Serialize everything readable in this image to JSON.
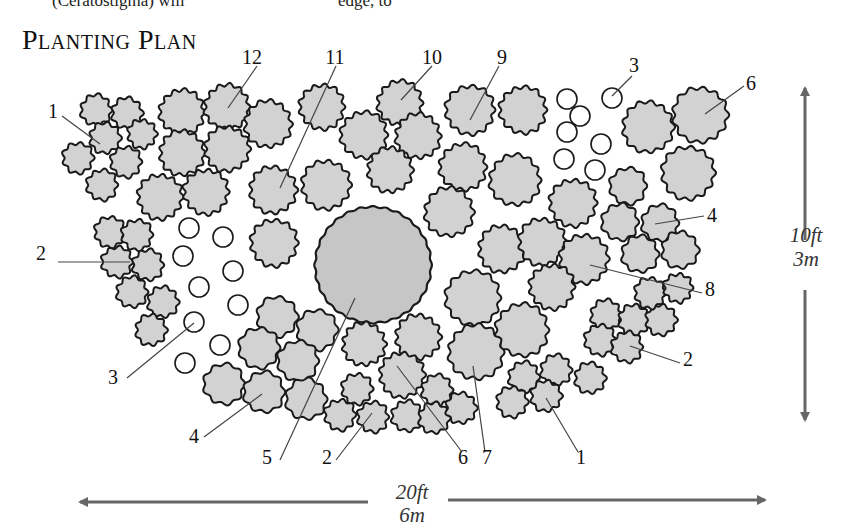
{
  "header": {
    "cut_text_left": "(Ceratostigma) will",
    "cut_text_right": "edge, to"
  },
  "title": "Planting Plan",
  "colors": {
    "plant_fill": "#d2d2d2",
    "plant_stroke": "#1a1a1a",
    "tree_fill": "#c6c6c6",
    "bulb_stroke": "#1a1a1a",
    "leader": "#444444",
    "arrow": "#666666"
  },
  "dimensions": {
    "height": {
      "ft": "10ft",
      "m": "3m"
    },
    "width": {
      "ft": "20ft",
      "m": "6m"
    }
  },
  "labels": [
    {
      "text": "1",
      "x": 53,
      "y": 118,
      "lx1": 62,
      "ly1": 116,
      "lx2": 100,
      "ly2": 144
    },
    {
      "text": "12",
      "x": 252,
      "y": 64,
      "lx1": 257,
      "ly1": 66,
      "lx2": 228,
      "ly2": 108
    },
    {
      "text": "11",
      "x": 335,
      "y": 64,
      "lx1": 336,
      "ly1": 66,
      "lx2": 280,
      "ly2": 188
    },
    {
      "text": "10",
      "x": 432,
      "y": 64,
      "lx1": 432,
      "ly1": 66,
      "lx2": 401,
      "ly2": 100
    },
    {
      "text": "9",
      "x": 502,
      "y": 64,
      "lx1": 499,
      "ly1": 66,
      "lx2": 470,
      "ly2": 120
    },
    {
      "text": "3",
      "x": 634,
      "y": 72,
      "lx1": 632,
      "ly1": 76,
      "lx2": 612,
      "ly2": 96
    },
    {
      "text": "6",
      "x": 751,
      "y": 90,
      "lx1": 744,
      "ly1": 86,
      "lx2": 705,
      "ly2": 114
    },
    {
      "text": "4",
      "x": 712,
      "y": 222,
      "lx1": 704,
      "ly1": 216,
      "lx2": 655,
      "ly2": 224
    },
    {
      "text": "8",
      "x": 710,
      "y": 296,
      "lx1": 702,
      "ly1": 293,
      "lx2": 590,
      "ly2": 265
    },
    {
      "text": "2",
      "x": 688,
      "y": 366,
      "lx1": 680,
      "ly1": 363,
      "lx2": 630,
      "ly2": 346
    },
    {
      "text": "1",
      "x": 581,
      "y": 464,
      "lx1": 578,
      "ly1": 452,
      "lx2": 546,
      "ly2": 398
    },
    {
      "text": "7",
      "x": 487,
      "y": 464,
      "lx1": 485,
      "ly1": 452,
      "lx2": 473,
      "ly2": 366
    },
    {
      "text": "6",
      "x": 463,
      "y": 464,
      "lx1": 462,
      "ly1": 452,
      "lx2": 397,
      "ly2": 366
    },
    {
      "text": "2",
      "x": 327,
      "y": 464,
      "lx1": 336,
      "ly1": 460,
      "lx2": 372,
      "ly2": 413
    },
    {
      "text": "5",
      "x": 267,
      "y": 464,
      "lx1": 280,
      "ly1": 460,
      "lx2": 355,
      "ly2": 298
    },
    {
      "text": "4",
      "x": 194,
      "y": 443,
      "lx1": 204,
      "ly1": 437,
      "lx2": 262,
      "ly2": 394
    },
    {
      "text": "3",
      "x": 113,
      "y": 384,
      "lx1": 127,
      "ly1": 378,
      "lx2": 194,
      "ly2": 323
    },
    {
      "text": "2",
      "x": 41,
      "y": 260,
      "lx1": 58,
      "ly1": 262,
      "lx2": 130,
      "ly2": 262
    }
  ],
  "tree": {
    "cx": 373,
    "cy": 265,
    "r": 58,
    "label": "5"
  },
  "shrubs": [
    {
      "cx": 96,
      "cy": 110,
      "r": 15
    },
    {
      "cx": 127,
      "cy": 113,
      "r": 15
    },
    {
      "cx": 105,
      "cy": 138,
      "r": 15
    },
    {
      "cx": 142,
      "cy": 134,
      "r": 14
    },
    {
      "cx": 78,
      "cy": 158,
      "r": 15
    },
    {
      "cx": 126,
      "cy": 162,
      "r": 15
    },
    {
      "cx": 102,
      "cy": 185,
      "r": 15
    },
    {
      "cx": 182,
      "cy": 112,
      "r": 22
    },
    {
      "cx": 227,
      "cy": 107,
      "r": 22
    },
    {
      "cx": 268,
      "cy": 124,
      "r": 23
    },
    {
      "cx": 182,
      "cy": 153,
      "r": 22
    },
    {
      "cx": 227,
      "cy": 149,
      "r": 22
    },
    {
      "cx": 160,
      "cy": 197,
      "r": 22
    },
    {
      "cx": 206,
      "cy": 192,
      "r": 22
    },
    {
      "cx": 322,
      "cy": 107,
      "r": 22
    },
    {
      "cx": 364,
      "cy": 135,
      "r": 23
    },
    {
      "cx": 400,
      "cy": 103,
      "r": 22
    },
    {
      "cx": 418,
      "cy": 136,
      "r": 22
    },
    {
      "cx": 390,
      "cy": 170,
      "r": 22
    },
    {
      "cx": 273,
      "cy": 190,
      "r": 23
    },
    {
      "cx": 326,
      "cy": 185,
      "r": 24
    },
    {
      "cx": 274,
      "cy": 243,
      "r": 23
    },
    {
      "cx": 470,
      "cy": 110,
      "r": 24
    },
    {
      "cx": 523,
      "cy": 110,
      "r": 23
    },
    {
      "cx": 463,
      "cy": 167,
      "r": 23
    },
    {
      "cx": 515,
      "cy": 180,
      "r": 25
    },
    {
      "cx": 449,
      "cy": 212,
      "r": 24
    },
    {
      "cx": 648,
      "cy": 127,
      "r": 25
    },
    {
      "cx": 700,
      "cy": 115,
      "r": 27
    },
    {
      "cx": 688,
      "cy": 173,
      "r": 26
    },
    {
      "cx": 573,
      "cy": 203,
      "r": 23
    },
    {
      "cx": 628,
      "cy": 186,
      "r": 18
    },
    {
      "cx": 620,
      "cy": 222,
      "r": 18
    },
    {
      "cx": 660,
      "cy": 223,
      "r": 18
    },
    {
      "cx": 640,
      "cy": 254,
      "r": 18
    },
    {
      "cx": 680,
      "cy": 250,
      "r": 18
    },
    {
      "cx": 502,
      "cy": 249,
      "r": 23
    },
    {
      "cx": 542,
      "cy": 242,
      "r": 23
    },
    {
      "cx": 584,
      "cy": 259,
      "r": 24
    },
    {
      "cx": 552,
      "cy": 287,
      "r": 22
    },
    {
      "cx": 473,
      "cy": 298,
      "r": 27
    },
    {
      "cx": 522,
      "cy": 330,
      "r": 26
    },
    {
      "cx": 476,
      "cy": 352,
      "r": 27
    },
    {
      "cx": 606,
      "cy": 315,
      "r": 15
    },
    {
      "cx": 634,
      "cy": 320,
      "r": 15
    },
    {
      "cx": 661,
      "cy": 320,
      "r": 15
    },
    {
      "cx": 650,
      "cy": 293,
      "r": 15
    },
    {
      "cx": 678,
      "cy": 288,
      "r": 14
    },
    {
      "cx": 600,
      "cy": 340,
      "r": 15
    },
    {
      "cx": 627,
      "cy": 347,
      "r": 15
    },
    {
      "cx": 524,
      "cy": 377,
      "r": 15
    },
    {
      "cx": 556,
      "cy": 370,
      "r": 15
    },
    {
      "cx": 590,
      "cy": 378,
      "r": 15
    },
    {
      "cx": 546,
      "cy": 396,
      "r": 15
    },
    {
      "cx": 512,
      "cy": 402,
      "r": 15
    },
    {
      "cx": 110,
      "cy": 232,
      "r": 15
    },
    {
      "cx": 137,
      "cy": 235,
      "r": 15
    },
    {
      "cx": 117,
      "cy": 262,
      "r": 15
    },
    {
      "cx": 148,
      "cy": 265,
      "r": 15
    },
    {
      "cx": 132,
      "cy": 292,
      "r": 15
    },
    {
      "cx": 163,
      "cy": 302,
      "r": 15
    },
    {
      "cx": 151,
      "cy": 330,
      "r": 15
    },
    {
      "cx": 277,
      "cy": 317,
      "r": 20
    },
    {
      "cx": 317,
      "cy": 330,
      "r": 20
    },
    {
      "cx": 259,
      "cy": 348,
      "r": 20
    },
    {
      "cx": 298,
      "cy": 361,
      "r": 20
    },
    {
      "cx": 224,
      "cy": 384,
      "r": 20
    },
    {
      "cx": 264,
      "cy": 392,
      "r": 20
    },
    {
      "cx": 306,
      "cy": 399,
      "r": 20
    },
    {
      "cx": 364,
      "cy": 344,
      "r": 21
    },
    {
      "cx": 418,
      "cy": 337,
      "r": 22
    },
    {
      "cx": 402,
      "cy": 375,
      "r": 22
    },
    {
      "cx": 357,
      "cy": 389,
      "r": 15
    },
    {
      "cx": 340,
      "cy": 415,
      "r": 15
    },
    {
      "cx": 373,
      "cy": 417,
      "r": 15
    },
    {
      "cx": 407,
      "cy": 416,
      "r": 15
    },
    {
      "cx": 437,
      "cy": 390,
      "r": 15
    },
    {
      "cx": 434,
      "cy": 418,
      "r": 15
    },
    {
      "cx": 461,
      "cy": 408,
      "r": 15
    }
  ],
  "bulbs": [
    {
      "cx": 567,
      "cy": 99
    },
    {
      "cx": 612,
      "cy": 98
    },
    {
      "cx": 580,
      "cy": 116
    },
    {
      "cx": 567,
      "cy": 132
    },
    {
      "cx": 601,
      "cy": 144
    },
    {
      "cx": 564,
      "cy": 159
    },
    {
      "cx": 595,
      "cy": 170
    },
    {
      "cx": 189,
      "cy": 228
    },
    {
      "cx": 223,
      "cy": 237
    },
    {
      "cx": 183,
      "cy": 256
    },
    {
      "cx": 233,
      "cy": 271
    },
    {
      "cx": 199,
      "cy": 287
    },
    {
      "cx": 238,
      "cy": 305
    },
    {
      "cx": 194,
      "cy": 322
    },
    {
      "cx": 220,
      "cy": 345
    },
    {
      "cx": 185,
      "cy": 363
    }
  ]
}
